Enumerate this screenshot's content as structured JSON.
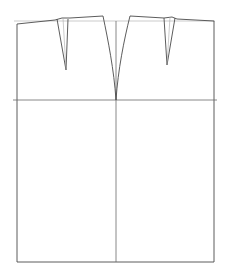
{
  "diagram": {
    "title": "",
    "type": "skirt-block-pattern",
    "stroke_color": "#4a4a4a",
    "background": "#ffffff",
    "labels": []
  },
  "geometry": {
    "left_x": 17,
    "right_x": 214,
    "center_x": 116,
    "waist_ref_y": 21,
    "hip_y": 100,
    "hem_y": 262
  }
}
